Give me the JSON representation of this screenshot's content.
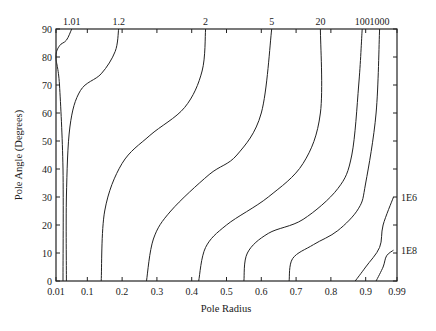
{
  "chart_data": {
    "type": "line",
    "subtype": "contour",
    "title": "",
    "xlabel": "Pole Radius",
    "ylabel": "Pole Angle (Degrees)",
    "xlim": [
      0.01,
      0.99
    ],
    "ylim": [
      0,
      90
    ],
    "x_ticks": [
      "0.01",
      "0.1",
      "0.2",
      "0.3",
      "0.4",
      "0.5",
      "0.6",
      "0.7",
      "0.8",
      "0.9",
      "0.99"
    ],
    "y_ticks": [
      "0",
      "10",
      "20",
      "30",
      "40",
      "50",
      "60",
      "70",
      "80",
      "90"
    ],
    "top_labels": [
      "1.01",
      "1.2",
      "2",
      "5",
      "20",
      "100",
      "1000"
    ],
    "right_labels": [
      "1E6",
      "1E8"
    ],
    "grid": false,
    "series": [
      {
        "name": "1.01",
        "points": [
          [
            0.03,
            0
          ],
          [
            0.03,
            40
          ],
          [
            0.02,
            70
          ],
          [
            0.01,
            80
          ],
          [
            0.02,
            84
          ],
          [
            0.04,
            86
          ],
          [
            0.055,
            90
          ]
        ]
      },
      {
        "name": "1.2",
        "points": [
          [
            0.04,
            0
          ],
          [
            0.04,
            30
          ],
          [
            0.05,
            55
          ],
          [
            0.08,
            68
          ],
          [
            0.14,
            74
          ],
          [
            0.18,
            82
          ],
          [
            0.19,
            90
          ]
        ]
      },
      {
        "name": "2",
        "points": [
          [
            0.14,
            0
          ],
          [
            0.15,
            25
          ],
          [
            0.2,
            42
          ],
          [
            0.28,
            52
          ],
          [
            0.38,
            62
          ],
          [
            0.43,
            75
          ],
          [
            0.44,
            90
          ]
        ]
      },
      {
        "name": "5",
        "points": [
          [
            0.27,
            0
          ],
          [
            0.29,
            15
          ],
          [
            0.34,
            25
          ],
          [
            0.45,
            38
          ],
          [
            0.53,
            45
          ],
          [
            0.6,
            60
          ],
          [
            0.63,
            90
          ]
        ]
      },
      {
        "name": "20",
        "points": [
          [
            0.42,
            0
          ],
          [
            0.44,
            12
          ],
          [
            0.5,
            20
          ],
          [
            0.62,
            30
          ],
          [
            0.72,
            42
          ],
          [
            0.77,
            60
          ],
          [
            0.77,
            90
          ]
        ]
      },
      {
        "name": "100",
        "points": [
          [
            0.55,
            0
          ],
          [
            0.56,
            10
          ],
          [
            0.62,
            17
          ],
          [
            0.72,
            22
          ],
          [
            0.82,
            33
          ],
          [
            0.86,
            45
          ],
          [
            0.88,
            70
          ],
          [
            0.89,
            90
          ]
        ]
      },
      {
        "name": "1000",
        "points": [
          [
            0.68,
            0
          ],
          [
            0.69,
            8
          ],
          [
            0.75,
            13
          ],
          [
            0.82,
            18
          ],
          [
            0.88,
            26
          ],
          [
            0.9,
            35
          ],
          [
            0.93,
            60
          ],
          [
            0.94,
            90
          ]
        ]
      },
      {
        "name": "1E6",
        "points": [
          [
            0.87,
            0
          ],
          [
            0.9,
            5
          ],
          [
            0.94,
            12
          ],
          [
            0.95,
            20
          ],
          [
            0.98,
            30
          ]
        ]
      },
      {
        "name": "1E8",
        "points": [
          [
            0.93,
            0
          ],
          [
            0.95,
            5
          ],
          [
            0.96,
            9
          ],
          [
            0.98,
            11
          ]
        ]
      }
    ]
  }
}
